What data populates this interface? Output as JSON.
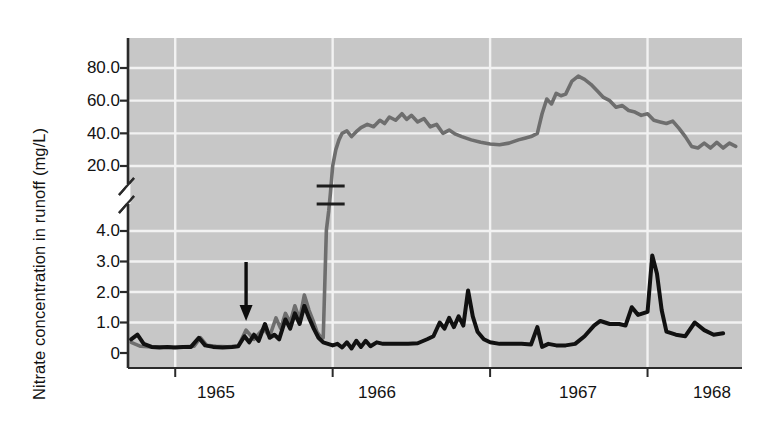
{
  "chart_data": {
    "type": "line",
    "title": "",
    "xlabel": "",
    "ylabel": "Nitrate concentration in runoff (mg/L)",
    "grid": true,
    "legend_position": "inline-annotation",
    "axis_break": {
      "present": true,
      "between": [
        4.0,
        20.0
      ],
      "symbol": "double-slash"
    },
    "ylim_lower": [
      0,
      4.0
    ],
    "ylim_upper": [
      20.0,
      90.0
    ],
    "ytick_labels": [
      "80.0",
      "60.0",
      "40.0",
      "20.0",
      "4.0",
      "3.0",
      "2.0",
      "1.0",
      "0"
    ],
    "ytick_values": [
      80.0,
      60.0,
      40.0,
      20.0,
      4.0,
      3.0,
      2.0,
      1.0,
      0
    ],
    "xtick_labels": [
      "1965",
      "1966",
      "1967",
      "1968"
    ],
    "x_axis_note": "time in years, monthly/weekly samples",
    "annotations": [
      {
        "name": "completion-of-tree-cutting",
        "text_line1": "Completion of",
        "text_line2": "tree cutting",
        "arrow": "down",
        "x_value": 1965.45
      },
      {
        "name": "series-break-marker",
        "text": "",
        "description": "axis break slash marks on Deforested line",
        "x_value": 1966.0
      }
    ],
    "series": [
      {
        "name": "Deforested",
        "color": "#6e6e6e",
        "label_x": 1966.9,
        "label_y": 60.0,
        "points": [
          [
            1964.72,
            0.35
          ],
          [
            1964.78,
            0.22
          ],
          [
            1964.85,
            0.2
          ],
          [
            1964.92,
            0.2
          ],
          [
            1964.99,
            0.18
          ],
          [
            1965.05,
            0.2
          ],
          [
            1965.12,
            0.22
          ],
          [
            1965.16,
            0.5
          ],
          [
            1965.2,
            0.25
          ],
          [
            1965.26,
            0.22
          ],
          [
            1965.33,
            0.2
          ],
          [
            1965.4,
            0.22
          ],
          [
            1965.45,
            0.75
          ],
          [
            1965.5,
            0.45
          ],
          [
            1965.56,
            0.8
          ],
          [
            1965.6,
            0.55
          ],
          [
            1965.64,
            1.15
          ],
          [
            1965.67,
            0.8
          ],
          [
            1965.7,
            1.3
          ],
          [
            1965.73,
            1.0
          ],
          [
            1965.76,
            1.55
          ],
          [
            1965.79,
            1.1
          ],
          [
            1965.82,
            1.9
          ],
          [
            1965.85,
            1.4
          ],
          [
            1965.88,
            1.0
          ],
          [
            1965.9,
            0.7
          ],
          [
            1965.92,
            0.55
          ],
          [
            1965.94,
            0.5
          ],
          [
            1965.96,
            4.2
          ],
          [
            1965.975,
            9.0
          ],
          [
            1965.985,
            13.0
          ],
          [
            1966.0,
            20.0
          ],
          [
            1966.02,
            30.0
          ],
          [
            1966.04,
            36.0
          ],
          [
            1966.06,
            40.0
          ],
          [
            1966.09,
            41.5
          ],
          [
            1966.12,
            38.0
          ],
          [
            1966.15,
            41.0
          ],
          [
            1966.18,
            43.5
          ],
          [
            1966.22,
            45.5
          ],
          [
            1966.26,
            44.0
          ],
          [
            1966.3,
            48.0
          ],
          [
            1966.33,
            46.0
          ],
          [
            1966.36,
            50.0
          ],
          [
            1966.4,
            48.0
          ],
          [
            1966.44,
            52.0
          ],
          [
            1966.47,
            48.5
          ],
          [
            1966.5,
            51.0
          ],
          [
            1966.54,
            47.0
          ],
          [
            1966.58,
            49.0
          ],
          [
            1966.62,
            44.0
          ],
          [
            1966.66,
            45.5
          ],
          [
            1966.7,
            40.0
          ],
          [
            1966.74,
            42.0
          ],
          [
            1966.78,
            39.5
          ],
          [
            1966.82,
            38.0
          ],
          [
            1966.88,
            36.0
          ],
          [
            1966.94,
            34.5
          ],
          [
            1967.0,
            33.5
          ],
          [
            1967.06,
            33.0
          ],
          [
            1967.12,
            34.0
          ],
          [
            1967.18,
            36.0
          ],
          [
            1967.22,
            37.0
          ],
          [
            1967.26,
            38.0
          ],
          [
            1967.3,
            40.0
          ],
          [
            1967.33,
            52.0
          ],
          [
            1967.36,
            61.0
          ],
          [
            1967.39,
            58.0
          ],
          [
            1967.42,
            64.5
          ],
          [
            1967.45,
            63.0
          ],
          [
            1967.48,
            64.0
          ],
          [
            1967.52,
            72.0
          ],
          [
            1967.56,
            75.0
          ],
          [
            1967.6,
            73.0
          ],
          [
            1967.64,
            70.0
          ],
          [
            1967.68,
            66.0
          ],
          [
            1967.72,
            62.0
          ],
          [
            1967.76,
            60.0
          ],
          [
            1967.8,
            56.0
          ],
          [
            1967.84,
            57.0
          ],
          [
            1967.88,
            54.0
          ],
          [
            1967.92,
            53.0
          ],
          [
            1967.96,
            51.0
          ],
          [
            1968.0,
            52.0
          ],
          [
            1968.04,
            48.0
          ],
          [
            1968.08,
            47.0
          ],
          [
            1968.12,
            46.0
          ],
          [
            1968.16,
            47.5
          ],
          [
            1968.2,
            43.0
          ],
          [
            1968.24,
            38.0
          ],
          [
            1968.28,
            32.0
          ],
          [
            1968.32,
            31.0
          ],
          [
            1968.36,
            34.0
          ],
          [
            1968.4,
            31.0
          ],
          [
            1968.44,
            34.5
          ],
          [
            1968.48,
            31.0
          ],
          [
            1968.52,
            34.0
          ],
          [
            1968.56,
            32.0
          ]
        ]
      },
      {
        "name": "Control",
        "color": "#111111",
        "label_x": 1966.75,
        "label_y": 2.55,
        "points": [
          [
            1964.72,
            0.45
          ],
          [
            1964.76,
            0.6
          ],
          [
            1964.8,
            0.3
          ],
          [
            1964.85,
            0.2
          ],
          [
            1964.9,
            0.18
          ],
          [
            1964.95,
            0.2
          ],
          [
            1965.0,
            0.18
          ],
          [
            1965.05,
            0.2
          ],
          [
            1965.1,
            0.2
          ],
          [
            1965.15,
            0.5
          ],
          [
            1965.19,
            0.25
          ],
          [
            1965.24,
            0.2
          ],
          [
            1965.3,
            0.18
          ],
          [
            1965.36,
            0.2
          ],
          [
            1965.4,
            0.22
          ],
          [
            1965.44,
            0.55
          ],
          [
            1965.47,
            0.35
          ],
          [
            1965.5,
            0.6
          ],
          [
            1965.53,
            0.4
          ],
          [
            1965.57,
            0.95
          ],
          [
            1965.6,
            0.5
          ],
          [
            1965.63,
            0.6
          ],
          [
            1965.66,
            0.45
          ],
          [
            1965.7,
            1.1
          ],
          [
            1965.73,
            0.8
          ],
          [
            1965.76,
            1.3
          ],
          [
            1965.79,
            0.95
          ],
          [
            1965.82,
            1.55
          ],
          [
            1965.85,
            1.15
          ],
          [
            1965.88,
            0.8
          ],
          [
            1965.91,
            0.5
          ],
          [
            1965.94,
            0.35
          ],
          [
            1965.97,
            0.3
          ],
          [
            1966.0,
            0.25
          ],
          [
            1966.03,
            0.3
          ],
          [
            1966.06,
            0.18
          ],
          [
            1966.09,
            0.35
          ],
          [
            1966.12,
            0.15
          ],
          [
            1966.15,
            0.4
          ],
          [
            1966.18,
            0.2
          ],
          [
            1966.21,
            0.4
          ],
          [
            1966.24,
            0.22
          ],
          [
            1966.28,
            0.35
          ],
          [
            1966.32,
            0.3
          ],
          [
            1966.36,
            0.3
          ],
          [
            1966.42,
            0.3
          ],
          [
            1966.48,
            0.3
          ],
          [
            1966.54,
            0.32
          ],
          [
            1966.6,
            0.45
          ],
          [
            1966.64,
            0.55
          ],
          [
            1966.68,
            1.0
          ],
          [
            1966.71,
            0.8
          ],
          [
            1966.74,
            1.15
          ],
          [
            1966.77,
            0.85
          ],
          [
            1966.8,
            1.2
          ],
          [
            1966.83,
            0.9
          ],
          [
            1966.86,
            2.05
          ],
          [
            1966.89,
            1.2
          ],
          [
            1966.92,
            0.7
          ],
          [
            1966.96,
            0.45
          ],
          [
            1967.0,
            0.35
          ],
          [
            1967.06,
            0.3
          ],
          [
            1967.14,
            0.3
          ],
          [
            1967.2,
            0.3
          ],
          [
            1967.26,
            0.28
          ],
          [
            1967.3,
            0.85
          ],
          [
            1967.33,
            0.2
          ],
          [
            1967.37,
            0.3
          ],
          [
            1967.42,
            0.25
          ],
          [
            1967.48,
            0.25
          ],
          [
            1967.54,
            0.3
          ],
          [
            1967.6,
            0.55
          ],
          [
            1967.66,
            0.9
          ],
          [
            1967.7,
            1.05
          ],
          [
            1967.76,
            0.95
          ],
          [
            1967.82,
            0.95
          ],
          [
            1967.86,
            0.9
          ],
          [
            1967.9,
            1.5
          ],
          [
            1967.94,
            1.25
          ],
          [
            1967.97,
            1.3
          ],
          [
            1968.0,
            1.35
          ],
          [
            1968.03,
            3.2
          ],
          [
            1968.06,
            2.6
          ],
          [
            1968.09,
            1.4
          ],
          [
            1968.12,
            0.7
          ],
          [
            1968.18,
            0.6
          ],
          [
            1968.24,
            0.55
          ],
          [
            1968.3,
            1.0
          ],
          [
            1968.36,
            0.75
          ],
          [
            1968.42,
            0.6
          ],
          [
            1968.48,
            0.65
          ]
        ]
      }
    ],
    "colors": {
      "plot_background": "#c7c7c7",
      "gridline": "#f2f2f2",
      "axis": "#2a2a2a",
      "deforested_line": "#6e6e6e",
      "control_line": "#111111",
      "text": "#131313"
    }
  }
}
